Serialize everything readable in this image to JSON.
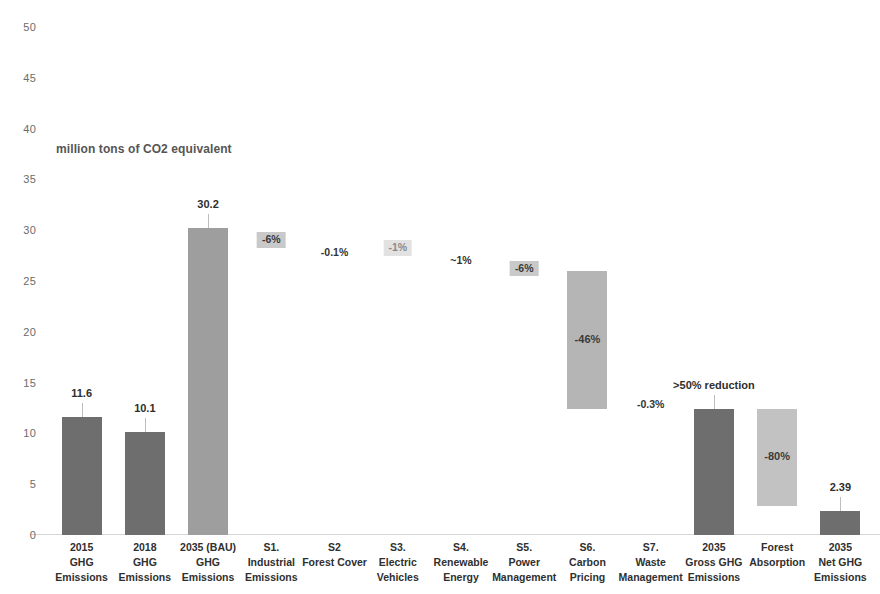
{
  "chart_data": {
    "type": "bar",
    "title": "",
    "subtitle": "million tons of CO2 equivalent",
    "xlabel": "",
    "ylabel": "",
    "ylim": [
      0,
      50
    ],
    "ytick_step": 5,
    "yticks": [
      "50",
      "45",
      "40",
      "35",
      "30",
      "25",
      "20",
      "15",
      "10",
      "5",
      "0"
    ],
    "grid": false,
    "legend": "none",
    "style": "waterfall",
    "colors": {
      "dark_bar": "#6e6e6e",
      "light_bar": "#9e9e9e",
      "annotation_box": "#c9c9c9",
      "axis_text": "#6b6b6b",
      "leader_line": "#bdbdbd"
    },
    "categories": [
      "2015\nGHG\nEmissions",
      "2018\nGHG\nEmissions",
      "2035 (BAU)\nGHG\nEmissions",
      "S1.\nIndustrial\nEmissions",
      "S2\nForest Cover",
      "S3.\nElectric\nVehicles",
      "S4.\nRenewable\nEnergy",
      "S5.\nPower\nManagement",
      "S6.\nCarbon\nPricing",
      "S7.\nWaste\nManagement",
      "2035\nGross GHG\nEmissions",
      "Forest\nAbsorption",
      "2035\nNet GHG\nEmissions"
    ],
    "bars": [
      {
        "key": "ghg-2015",
        "label_lines": [
          "2015",
          "GHG",
          "Emissions"
        ],
        "kind": "total",
        "base": 0,
        "top": 11.6,
        "value_label": "11.6",
        "inner_label": "",
        "color": "#6e6e6e"
      },
      {
        "key": "ghg-2018",
        "label_lines": [
          "2018",
          "GHG",
          "Emissions"
        ],
        "kind": "total",
        "base": 0,
        "top": 10.1,
        "value_label": "10.1",
        "inner_label": "",
        "color": "#6e6e6e"
      },
      {
        "key": "ghg-2035-bau",
        "label_lines": [
          "2035 (BAU)",
          "GHG",
          "Emissions"
        ],
        "kind": "total",
        "base": 0,
        "top": 30.2,
        "value_label": "30.2",
        "inner_label": "",
        "color": "#9e9e9e"
      },
      {
        "key": "s1-industrial-emissions",
        "label_lines": [
          "S1.",
          "Industrial",
          "Emissions"
        ],
        "kind": "annotation-only",
        "base": 29.0,
        "top": 29.0,
        "value_label": "",
        "inner_label": "-6%",
        "annotation": "-6%",
        "annotation_style": "boxed",
        "color": "#c9c9c9"
      },
      {
        "key": "s2-forest-cover",
        "label_lines": [
          "S2",
          "Forest Cover",
          ""
        ],
        "kind": "annotation-only",
        "base": 27.8,
        "top": 27.8,
        "value_label": "",
        "inner_label": "-0.1%",
        "annotation": "-0.1%",
        "annotation_style": "plain",
        "color": "#ffffff"
      },
      {
        "key": "s3-electric-vehicles",
        "label_lines": [
          "S3.",
          "Electric",
          "Vehicles"
        ],
        "kind": "annotation-only",
        "base": 28.2,
        "top": 28.2,
        "value_label": "",
        "inner_label": "-1%",
        "annotation": "-1%",
        "annotation_style": "faint",
        "color": "#e2e2e2"
      },
      {
        "key": "s4-renewable-energy",
        "label_lines": [
          "S4.",
          "Renewable",
          "Energy"
        ],
        "kind": "annotation-only",
        "base": 27.0,
        "top": 27.0,
        "value_label": "",
        "inner_label": "~1%",
        "annotation": "~1%",
        "annotation_style": "plain",
        "color": "#ffffff"
      },
      {
        "key": "s5-power-management",
        "label_lines": [
          "S5.",
          "Power",
          "Management"
        ],
        "kind": "annotation-only",
        "base": 26.2,
        "top": 26.2,
        "value_label": "",
        "inner_label": "-6%",
        "annotation": "-6%",
        "annotation_style": "boxed",
        "color": "#c9c9c9"
      },
      {
        "key": "s6-carbon-pricing",
        "label_lines": [
          "S6.",
          "Carbon",
          "Pricing"
        ],
        "kind": "floating",
        "base": 12.4,
        "top": 26.0,
        "value_label": "",
        "inner_label": "-46%",
        "annotation": "-46%",
        "annotation_style": "inside",
        "color": "#b5b5b5"
      },
      {
        "key": "s7-waste-management",
        "label_lines": [
          "S7.",
          "Waste",
          "Management"
        ],
        "kind": "annotation-only",
        "base": 12.8,
        "top": 12.8,
        "value_label": "",
        "inner_label": "-0.3%",
        "annotation": "-0.3%",
        "annotation_style": "plain",
        "color": "#ffffff"
      },
      {
        "key": "gross-ghg-2035",
        "label_lines": [
          "2035",
          "Gross GHG",
          "Emissions"
        ],
        "kind": "total",
        "base": 0,
        "top": 12.4,
        "value_label": ">50% reduction",
        "inner_label": "",
        "color": "#6e6e6e"
      },
      {
        "key": "forest-absorption",
        "label_lines": [
          "Forest",
          "Absorption",
          ""
        ],
        "kind": "floating",
        "base": 2.9,
        "top": 12.4,
        "value_label": "",
        "inner_label": "-80%",
        "annotation": "-80%",
        "annotation_style": "inside",
        "color": "#c2c2c2"
      },
      {
        "key": "net-ghg-2035",
        "label_lines": [
          "2035",
          "Net GHG",
          "Emissions"
        ],
        "kind": "total",
        "base": 0,
        "top": 2.39,
        "value_label": "2.39",
        "inner_label": "",
        "color": "#6e6e6e"
      }
    ]
  }
}
